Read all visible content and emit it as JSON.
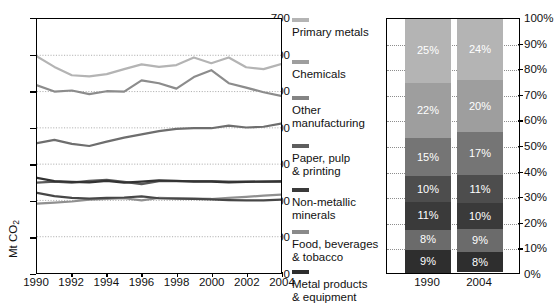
{
  "chart_data": [
    {
      "type": "line",
      "title": "",
      "xlabel": "",
      "ylabel": "Mt CO2",
      "ylabel_display": "Mt CO",
      "ylabel_sub": "2",
      "xlim": [
        1990,
        2004
      ],
      "ylim": [
        0,
        700
      ],
      "ytick_labels": [
        "700",
        "600",
        "500",
        "400",
        "300",
        "200",
        "100",
        "0"
      ],
      "ytick_values": [
        700,
        600,
        500,
        400,
        300,
        200,
        100,
        0
      ],
      "xtick_labels": [
        "1990",
        "1992",
        "1994",
        "1996",
        "1998",
        "2000",
        "2002",
        "2004"
      ],
      "xtick_values": [
        1990,
        1992,
        1994,
        1996,
        1998,
        2000,
        2002,
        2004
      ],
      "x": [
        1990,
        1991,
        1992,
        1993,
        1994,
        1995,
        1996,
        1997,
        1998,
        1999,
        2000,
        2001,
        2002,
        2003,
        2004
      ],
      "grid": "horizontal-dotted",
      "series": [
        {
          "name": "Primary metals",
          "color": "#b4b4b4",
          "values": [
            597,
            568,
            545,
            542,
            548,
            562,
            575,
            568,
            573,
            594,
            578,
            594,
            567,
            562,
            576
          ]
        },
        {
          "name": "Chemicals",
          "color": "#8c8c8c",
          "values": [
            517,
            500,
            503,
            493,
            501,
            500,
            531,
            523,
            508,
            540,
            559,
            523,
            511,
            498,
            488
          ]
        },
        {
          "name": "Other manufacturing",
          "color": "#6e6e6e",
          "values": [
            358,
            367,
            356,
            350,
            362,
            373,
            382,
            391,
            397,
            399,
            399,
            406,
            401,
            403,
            412
          ]
        },
        {
          "name": "Paper, pulp & printing",
          "color": "#5a5a5a",
          "values": [
            249,
            252,
            249,
            254,
            257,
            251,
            245,
            253,
            253,
            253,
            253,
            252,
            252,
            252,
            253
          ]
        },
        {
          "name": "Non-metallic minerals",
          "color": "#333333",
          "values": [
            262,
            253,
            251,
            250,
            254,
            249,
            252,
            255,
            254,
            252,
            252,
            250,
            251,
            252,
            252
          ]
        },
        {
          "name": "Food, beverages & tobacco",
          "color": "#909090",
          "values": [
            191,
            194,
            197,
            202,
            204,
            206,
            200,
            207,
            206,
            205,
            204,
            207,
            210,
            213,
            216
          ]
        },
        {
          "name": "Metal products & equipment",
          "color": "#474747",
          "values": [
            221,
            212,
            207,
            205,
            207,
            208,
            211,
            206,
            205,
            204,
            203,
            201,
            200,
            200,
            202
          ]
        }
      ]
    },
    {
      "type": "bar",
      "subtype": "stacked-100",
      "categories": [
        "1990",
        "2004"
      ],
      "ytick_labels": [
        "100%",
        "90%",
        "80%",
        "70%",
        "60%",
        "50%",
        "40%",
        "30%",
        "20%",
        "10%",
        "0%"
      ],
      "ytick_values": [
        100,
        90,
        80,
        70,
        60,
        50,
        40,
        30,
        20,
        10,
        0
      ],
      "ylim": [
        0,
        100
      ],
      "legend_position": "left-external",
      "series": [
        {
          "name": "Primary metals",
          "color": "#b4b4b4",
          "values": [
            25,
            24
          ],
          "labels": [
            "25%",
            "24%"
          ]
        },
        {
          "name": "Chemicals",
          "color": "#9e9e9e",
          "values": [
            22,
            20
          ],
          "labels": [
            "22%",
            "20%"
          ]
        },
        {
          "name": "Other manufacturing",
          "color": "#757575",
          "values": [
            15,
            17
          ],
          "labels": [
            "15%",
            "17%"
          ]
        },
        {
          "name": "Paper, pulp & printing",
          "color": "#4d4d4d",
          "values": [
            10,
            11
          ],
          "labels": [
            "10%",
            "11%"
          ]
        },
        {
          "name": "Non-metallic minerals",
          "color": "#3a3a3a",
          "values": [
            11,
            10
          ],
          "labels": [
            "11%",
            "10%"
          ]
        },
        {
          "name": "Food, beverages & tobacco",
          "color": "#6b6b6b",
          "values": [
            8,
            9
          ],
          "labels": [
            "8%",
            "9%"
          ]
        },
        {
          "name": "Metal products & equipment",
          "color": "#2e2e2e",
          "values": [
            9,
            8
          ],
          "labels": [
            "9%",
            "8%"
          ]
        }
      ]
    }
  ],
  "legend": {
    "items": [
      {
        "label_line1": "Primary metals",
        "label_line2": "",
        "color": "#b4b4b4"
      },
      {
        "label_line1": "Chemicals",
        "label_line2": "",
        "color": "#9e9e9e"
      },
      {
        "label_line1": "Other",
        "label_line2": "manufacturing",
        "color": "#848484"
      },
      {
        "label_line1": "Paper, pulp",
        "label_line2": "& printing",
        "color": "#5e5e5e"
      },
      {
        "label_line1": "Non-metallic",
        "label_line2": "minerals",
        "color": "#3a3a3a"
      },
      {
        "label_line1": "Food, beverages",
        "label_line2": "& tobacco",
        "color": "#8a8a8a"
      },
      {
        "label_line1": "Metal products",
        "label_line2": "& equipment",
        "color": "#2e2e2e"
      }
    ]
  }
}
